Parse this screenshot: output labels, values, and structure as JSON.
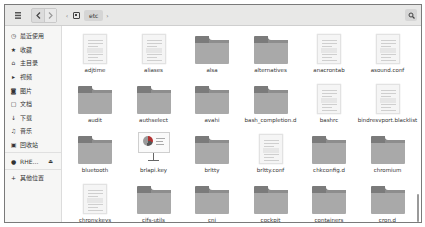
{
  "toolbar": {
    "menu_icon": "menu-icon",
    "back_icon": "back-arrow-icon",
    "forward_icon": "forward-arrow-icon",
    "breadcrumb": {
      "left_arrow": "‹",
      "home_icon": "drive-icon",
      "current": "etc",
      "right_arrow": "›"
    },
    "search_icon": "search-icon"
  },
  "sidebar": {
    "items": [
      {
        "icon": "◷",
        "icon_name": "recent-icon",
        "label": "最近使用"
      },
      {
        "icon": "★",
        "icon_name": "star-icon",
        "label": "收藏"
      },
      {
        "icon": "⌂",
        "icon_name": "home-icon",
        "label": "主目录"
      },
      {
        "icon": "▸",
        "icon_name": "video-icon",
        "label": "视频"
      },
      {
        "icon": "◙",
        "icon_name": "pictures-icon",
        "label": "图片"
      },
      {
        "icon": "▢",
        "icon_name": "documents-icon",
        "label": "文档"
      },
      {
        "icon": "↓",
        "icon_name": "download-icon",
        "label": "下载"
      },
      {
        "icon": "♫",
        "icon_name": "music-icon",
        "label": "音乐"
      },
      {
        "icon": "▣",
        "icon_name": "trash-icon",
        "label": "回收站"
      }
    ],
    "devices": [
      {
        "icon": "●",
        "icon_name": "disk-icon",
        "label": "RHE…",
        "eject": "⏏"
      }
    ],
    "other": {
      "icon": "+",
      "icon_name": "plus-icon",
      "label": "其他位置"
    }
  },
  "files": [
    {
      "name": "adjtime",
      "type": "doc"
    },
    {
      "name": "aliases",
      "type": "doc"
    },
    {
      "name": "alsa",
      "type": "folder"
    },
    {
      "name": "alternatives",
      "type": "folder"
    },
    {
      "name": "anacrontab",
      "type": "doc"
    },
    {
      "name": "asound.conf",
      "type": "doc"
    },
    {
      "name": "audit",
      "type": "folder"
    },
    {
      "name": "authselect",
      "type": "folder"
    },
    {
      "name": "avahi",
      "type": "folder"
    },
    {
      "name": "bash_completion.d",
      "type": "folder"
    },
    {
      "name": "bashrc",
      "type": "doc"
    },
    {
      "name": "bindresvport.blacklist",
      "type": "doc"
    },
    {
      "name": "bluetooth",
      "type": "folder"
    },
    {
      "name": "brlapi.key",
      "type": "presentation"
    },
    {
      "name": "brltty",
      "type": "folder"
    },
    {
      "name": "brltty.conf",
      "type": "doc"
    },
    {
      "name": "chkconfig.d",
      "type": "folder"
    },
    {
      "name": "chromium",
      "type": "folder"
    },
    {
      "name": "chrony.keys",
      "type": "doc"
    },
    {
      "name": "cifs-utils",
      "type": "folder"
    },
    {
      "name": "cni",
      "type": "folder"
    },
    {
      "name": "cockpit",
      "type": "folder"
    },
    {
      "name": "containers",
      "type": "folder"
    },
    {
      "name": "cron.d",
      "type": "folder"
    }
  ]
}
